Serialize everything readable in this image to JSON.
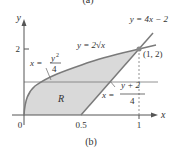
{
  "top_caption": "(a)",
  "caption": "(b)",
  "axes": {
    "x_label": "x",
    "y_label": "y",
    "origin_label": "0",
    "x_ticks": [
      "0.5",
      "1"
    ],
    "y_ticks": [
      "2"
    ]
  },
  "curves": {
    "parabola": {
      "lhs": "x =",
      "num": "y",
      "num_exp": "2",
      "den": "4"
    },
    "sqrt": {
      "text": "y = 2√x"
    },
    "line": {
      "text": "y = 4x − 2"
    },
    "line_inverse": {
      "lhs": "x =",
      "num": "y + 2",
      "den": "4"
    }
  },
  "point": {
    "label": "(1, 2)"
  },
  "region": {
    "label": "R",
    "fill": "#d9d9d9"
  },
  "colors": {
    "curve": "#7a7a7a",
    "axis": "#555555",
    "text": "#333333"
  }
}
